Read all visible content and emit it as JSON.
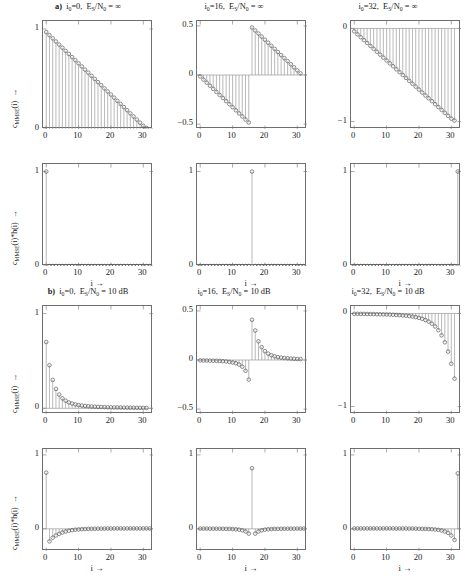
{
  "figure": {
    "xlabel": "i →",
    "row1_ylabel": "c_MMSE(i) →",
    "row2_ylabel": "c_MMSE(i)*h(i) →"
  },
  "sections": [
    {
      "tag": "a)",
      "panels": [
        {
          "i0": "i0=0",
          "snr": "ES/N0 = ∞"
        },
        {
          "i0": "i0=16",
          "snr": "ES/N0 = ∞"
        },
        {
          "i0": "i0=32",
          "snr": "ES/N0 = ∞"
        }
      ]
    },
    {
      "tag": "b)",
      "panels": [
        {
          "i0": "i0=0",
          "snr": "ES/N0 = 10 dB"
        },
        {
          "i0": "i0=16",
          "snr": "ES/N0 = 10 dB"
        },
        {
          "i0": "i0=32",
          "snr": "ES/N0 = 10 dB"
        }
      ]
    }
  ],
  "chart_data": [
    {
      "id": "a1-coeff",
      "type": "line",
      "title": "a)  i0=0, ES/N0 = ∞",
      "xlabel": "i →",
      "ylabel": "c_MMSE(i) →",
      "xlim": [
        -1,
        33
      ],
      "ylim": [
        0,
        1.08
      ],
      "xticks": [
        0,
        10,
        20,
        30
      ],
      "yticks": [
        0,
        1
      ],
      "ytick_labels": [
        "0",
        "1"
      ],
      "x": [
        0,
        1,
        2,
        3,
        4,
        5,
        6,
        7,
        8,
        9,
        10,
        11,
        12,
        13,
        14,
        15,
        16,
        17,
        18,
        19,
        20,
        21,
        22,
        23,
        24,
        25,
        26,
        27,
        28,
        29,
        30,
        31
      ],
      "values": [
        0.969,
        0.938,
        0.906,
        0.875,
        0.844,
        0.813,
        0.781,
        0.75,
        0.719,
        0.688,
        0.656,
        0.625,
        0.594,
        0.563,
        0.531,
        0.5,
        0.469,
        0.438,
        0.406,
        0.375,
        0.344,
        0.313,
        0.281,
        0.25,
        0.219,
        0.188,
        0.156,
        0.125,
        0.094,
        0.063,
        0.031,
        0.01
      ]
    },
    {
      "id": "a2-coeff",
      "type": "line",
      "title": "i0=16, ES/N0 = ∞",
      "xlabel": "i →",
      "ylabel": "",
      "xlim": [
        -1,
        33
      ],
      "ylim": [
        -0.55,
        0.55
      ],
      "xticks": [
        0,
        10,
        20,
        30
      ],
      "yticks": [
        -0.5,
        0,
        0.5
      ],
      "ytick_labels": [
        "−0.5",
        "0",
        "0.5"
      ],
      "x": [
        0,
        1,
        2,
        3,
        4,
        5,
        6,
        7,
        8,
        9,
        10,
        11,
        12,
        13,
        14,
        15,
        16,
        17,
        18,
        19,
        20,
        21,
        22,
        23,
        24,
        25,
        26,
        27,
        28,
        29,
        30,
        31
      ],
      "values": [
        -0.015,
        -0.047,
        -0.078,
        -0.109,
        -0.141,
        -0.172,
        -0.203,
        -0.234,
        -0.266,
        -0.297,
        -0.328,
        -0.359,
        -0.391,
        -0.422,
        -0.453,
        -0.484,
        0.484,
        0.453,
        0.422,
        0.391,
        0.359,
        0.328,
        0.297,
        0.266,
        0.234,
        0.203,
        0.172,
        0.141,
        0.109,
        0.078,
        0.047,
        0.016
      ]
    },
    {
      "id": "a3-coeff",
      "type": "line",
      "title": "i0=32, ES/N0 = ∞",
      "xlabel": "i →",
      "ylabel": "",
      "xlim": [
        -1,
        33
      ],
      "ylim": [
        -1.08,
        0.08
      ],
      "xticks": [
        0,
        10,
        20,
        30
      ],
      "yticks": [
        -1,
        0
      ],
      "ytick_labels": [
        "−1",
        "0"
      ],
      "x": [
        0,
        1,
        2,
        3,
        4,
        5,
        6,
        7,
        8,
        9,
        10,
        11,
        12,
        13,
        14,
        15,
        16,
        17,
        18,
        19,
        20,
        21,
        22,
        23,
        24,
        25,
        26,
        27,
        28,
        29,
        30,
        31
      ],
      "values": [
        -0.031,
        -0.063,
        -0.094,
        -0.125,
        -0.156,
        -0.188,
        -0.219,
        -0.25,
        -0.281,
        -0.313,
        -0.344,
        -0.375,
        -0.406,
        -0.438,
        -0.469,
        -0.5,
        -0.531,
        -0.563,
        -0.594,
        -0.625,
        -0.656,
        -0.688,
        -0.719,
        -0.75,
        -0.781,
        -0.813,
        -0.844,
        -0.875,
        -0.906,
        -0.938,
        -0.969,
        -0.99
      ]
    },
    {
      "id": "a1-conv",
      "type": "line",
      "title": "",
      "xlabel": "i →",
      "ylabel": "c_MMSE(i)*h(i) →",
      "xlim": [
        -1,
        33
      ],
      "ylim": [
        0,
        1.08
      ],
      "xticks": [
        0,
        10,
        20,
        30
      ],
      "yticks": [
        0,
        1
      ],
      "ytick_labels": [
        "0",
        "1"
      ],
      "x": [
        0,
        1,
        2,
        3,
        4,
        5,
        6,
        7,
        8,
        9,
        10,
        11,
        12,
        13,
        14,
        15,
        16,
        17,
        18,
        19,
        20,
        21,
        22,
        23,
        24,
        25,
        26,
        27,
        28,
        29,
        30,
        31,
        32
      ],
      "values": [
        1.0,
        0,
        0,
        0,
        0,
        0,
        0,
        0,
        0,
        0,
        0,
        0,
        0,
        0,
        0,
        0,
        0,
        0,
        0,
        0,
        0,
        0,
        0,
        0,
        0,
        0,
        0,
        0,
        0,
        0,
        0,
        0,
        0
      ]
    },
    {
      "id": "a2-conv",
      "type": "line",
      "title": "",
      "xlabel": "i →",
      "ylabel": "",
      "xlim": [
        -1,
        33
      ],
      "ylim": [
        0,
        1.08
      ],
      "xticks": [
        0,
        10,
        20,
        30
      ],
      "yticks": [
        0,
        1
      ],
      "ytick_labels": [
        "0",
        "1"
      ],
      "x": [
        0,
        1,
        2,
        3,
        4,
        5,
        6,
        7,
        8,
        9,
        10,
        11,
        12,
        13,
        14,
        15,
        16,
        17,
        18,
        19,
        20,
        21,
        22,
        23,
        24,
        25,
        26,
        27,
        28,
        29,
        30,
        31,
        32
      ],
      "values": [
        0,
        0,
        0,
        0,
        0,
        0,
        0,
        0,
        0,
        0,
        0,
        0,
        0,
        0,
        0,
        0,
        1.0,
        0,
        0,
        0,
        0,
        0,
        0,
        0,
        0,
        0,
        0,
        0,
        0,
        0,
        0,
        0,
        0
      ]
    },
    {
      "id": "a3-conv",
      "type": "line",
      "title": "",
      "xlabel": "i →",
      "ylabel": "",
      "xlim": [
        -1,
        33
      ],
      "ylim": [
        0,
        1.08
      ],
      "xticks": [
        0,
        10,
        20,
        30
      ],
      "yticks": [
        0,
        1
      ],
      "ytick_labels": [
        "0",
        "1"
      ],
      "x": [
        0,
        1,
        2,
        3,
        4,
        5,
        6,
        7,
        8,
        9,
        10,
        11,
        12,
        13,
        14,
        15,
        16,
        17,
        18,
        19,
        20,
        21,
        22,
        23,
        24,
        25,
        26,
        27,
        28,
        29,
        30,
        31,
        32
      ],
      "values": [
        0,
        0,
        0,
        0,
        0,
        0,
        0,
        0,
        0,
        0,
        0,
        0,
        0,
        0,
        0,
        0,
        0,
        0,
        0,
        0,
        0,
        0,
        0,
        0,
        0,
        0,
        0,
        0,
        0,
        0,
        0,
        0,
        1.0
      ]
    },
    {
      "id": "b1-coeff",
      "type": "line",
      "title": "b)  i0=0, ES/N0 = 10 dB",
      "xlabel": "i →",
      "ylabel": "c_MMSE(i) →",
      "xlim": [
        -1,
        33
      ],
      "ylim": [
        -0.06,
        1.08
      ],
      "xticks": [
        0,
        10,
        20,
        30
      ],
      "yticks": [
        0,
        1
      ],
      "ytick_labels": [
        "0",
        "1"
      ],
      "x": [
        0,
        1,
        2,
        3,
        4,
        5,
        6,
        7,
        8,
        9,
        10,
        11,
        12,
        13,
        14,
        15,
        16,
        17,
        18,
        19,
        20,
        21,
        22,
        23,
        24,
        25,
        26,
        27,
        28,
        29,
        30,
        31
      ],
      "values": [
        0.7,
        0.455,
        0.3,
        0.205,
        0.145,
        0.105,
        0.08,
        0.062,
        0.05,
        0.041,
        0.034,
        0.029,
        0.025,
        0.022,
        0.019,
        0.017,
        0.015,
        0.014,
        0.012,
        0.011,
        0.01,
        0.009,
        0.009,
        0.008,
        0.007,
        0.007,
        0.006,
        0.006,
        0.005,
        0.005,
        0.004,
        0.004
      ]
    },
    {
      "id": "b2-coeff",
      "type": "line",
      "title": "i0=16, ES/N0 = 10 dB",
      "xlabel": "i →",
      "ylabel": "",
      "xlim": [
        -1,
        33
      ],
      "ylim": [
        -0.55,
        0.55
      ],
      "xticks": [
        0,
        10,
        20,
        30
      ],
      "yticks": [
        -0.5,
        0,
        0.5
      ],
      "ytick_labels": [
        "−0.5",
        "0",
        "0.5"
      ],
      "x": [
        0,
        1,
        2,
        3,
        4,
        5,
        6,
        7,
        8,
        9,
        10,
        11,
        12,
        13,
        14,
        15,
        16,
        17,
        18,
        19,
        20,
        21,
        22,
        23,
        24,
        25,
        26,
        27,
        28,
        29,
        30,
        31
      ],
      "values": [
        -0.004,
        -0.005,
        -0.005,
        -0.006,
        -0.007,
        -0.008,
        -0.01,
        -0.012,
        -0.015,
        -0.019,
        -0.025,
        -0.033,
        -0.046,
        -0.068,
        -0.11,
        -0.2,
        0.41,
        0.3,
        0.19,
        0.13,
        0.09,
        0.065,
        0.048,
        0.037,
        0.029,
        0.024,
        0.02,
        0.017,
        0.014,
        0.012,
        0.01,
        0.009
      ]
    },
    {
      "id": "b3-coeff",
      "type": "line",
      "title": "i0=32, ES/N0 = 10 dB",
      "xlabel": "i →",
      "ylabel": "",
      "xlim": [
        -1,
        33
      ],
      "ylim": [
        -1.08,
        0.08
      ],
      "xticks": [
        0,
        10,
        20,
        30
      ],
      "yticks": [
        -1,
        0
      ],
      "ytick_labels": [
        "−1",
        "0"
      ],
      "x": [
        0,
        1,
        2,
        3,
        4,
        5,
        6,
        7,
        8,
        9,
        10,
        11,
        12,
        13,
        14,
        15,
        16,
        17,
        18,
        19,
        20,
        21,
        22,
        23,
        24,
        25,
        26,
        27,
        28,
        29,
        30,
        31
      ],
      "values": [
        -0.004,
        -0.004,
        -0.005,
        -0.005,
        -0.006,
        -0.006,
        -0.007,
        -0.008,
        -0.009,
        -0.01,
        -0.011,
        -0.012,
        -0.014,
        -0.016,
        -0.018,
        -0.021,
        -0.024,
        -0.028,
        -0.033,
        -0.039,
        -0.047,
        -0.057,
        -0.07,
        -0.087,
        -0.11,
        -0.14,
        -0.18,
        -0.235,
        -0.31,
        -0.41,
        -0.54,
        -0.7
      ]
    },
    {
      "id": "b1-conv",
      "type": "line",
      "title": "",
      "xlabel": "i →",
      "ylabel": "c_MMSE(i)*h(i) →",
      "xlim": [
        -1,
        33
      ],
      "ylim": [
        -0.3,
        1.08
      ],
      "xticks": [
        0,
        10,
        20,
        30
      ],
      "yticks": [
        0,
        1
      ],
      "ytick_labels": [
        "0",
        "1"
      ],
      "x": [
        0,
        1,
        2,
        3,
        4,
        5,
        6,
        7,
        8,
        9,
        10,
        11,
        12,
        13,
        14,
        15,
        16,
        17,
        18,
        19,
        20,
        21,
        22,
        23,
        24,
        25,
        26,
        27,
        28,
        29,
        30,
        31,
        32
      ],
      "values": [
        0.76,
        -0.17,
        -0.12,
        -0.09,
        -0.068,
        -0.05,
        -0.036,
        -0.026,
        -0.018,
        -0.012,
        -0.008,
        -0.005,
        -0.003,
        -0.001,
        0.0,
        0.001,
        0.002,
        0.003,
        0.003,
        0.004,
        0.004,
        0.004,
        0.005,
        0.005,
        0.005,
        0.005,
        0.005,
        0.005,
        0.005,
        0.005,
        0.005,
        0.005,
        0.005
      ]
    },
    {
      "id": "b2-conv",
      "type": "line",
      "title": "",
      "xlabel": "i →",
      "ylabel": "",
      "xlim": [
        -1,
        33
      ],
      "ylim": [
        -0.3,
        1.08
      ],
      "xticks": [
        0,
        10,
        20,
        30
      ],
      "yticks": [
        0,
        1
      ],
      "ytick_labels": [
        "0",
        "1"
      ],
      "x": [
        0,
        1,
        2,
        3,
        4,
        5,
        6,
        7,
        8,
        9,
        10,
        11,
        12,
        13,
        14,
        15,
        16,
        17,
        18,
        19,
        20,
        21,
        22,
        23,
        24,
        25,
        26,
        27,
        28,
        29,
        30,
        31,
        32
      ],
      "values": [
        0.003,
        0.003,
        0.003,
        0.002,
        0.002,
        0.002,
        0.001,
        0.001,
        0.0,
        -0.001,
        -0.003,
        -0.006,
        -0.011,
        -0.02,
        -0.036,
        -0.065,
        0.82,
        -0.065,
        -0.036,
        -0.02,
        -0.011,
        -0.006,
        -0.003,
        -0.001,
        0.0,
        0.001,
        0.001,
        0.002,
        0.002,
        0.002,
        0.003,
        0.003,
        0.003
      ]
    },
    {
      "id": "b3-conv",
      "type": "line",
      "title": "",
      "xlabel": "i →",
      "ylabel": "",
      "xlim": [
        -1,
        33
      ],
      "ylim": [
        -0.3,
        1.08
      ],
      "xticks": [
        0,
        10,
        20,
        30
      ],
      "yticks": [
        0,
        1
      ],
      "ytick_labels": [
        "0",
        "1"
      ],
      "x": [
        0,
        1,
        2,
        3,
        4,
        5,
        6,
        7,
        8,
        9,
        10,
        11,
        12,
        13,
        14,
        15,
        16,
        17,
        18,
        19,
        20,
        21,
        22,
        23,
        24,
        25,
        26,
        27,
        28,
        29,
        30,
        31,
        32
      ],
      "values": [
        0.005,
        0.005,
        0.005,
        0.005,
        0.005,
        0.005,
        0.005,
        0.005,
        0.005,
        0.005,
        0.005,
        0.005,
        0.005,
        0.004,
        0.004,
        0.004,
        0.004,
        0.003,
        0.003,
        0.002,
        0.001,
        0.0,
        -0.001,
        -0.003,
        -0.005,
        -0.009,
        -0.014,
        -0.022,
        -0.035,
        -0.055,
        -0.09,
        -0.15,
        0.75
      ]
    }
  ]
}
